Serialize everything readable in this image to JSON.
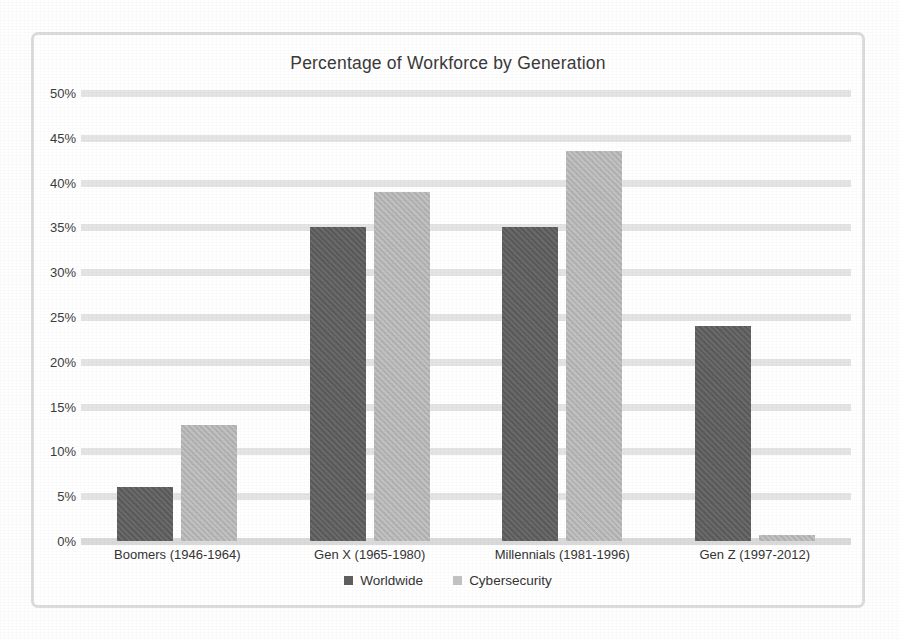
{
  "chart_data": {
    "type": "bar",
    "title": "Percentage of Workforce by Generation",
    "xlabel": "",
    "ylabel": "",
    "ylim": [
      0,
      50
    ],
    "ytick_labels": [
      "50%",
      "45%",
      "40%",
      "35%",
      "30%",
      "25%",
      "20%",
      "15%",
      "10%",
      "5%",
      "0%"
    ],
    "ytick_values": [
      50,
      45,
      40,
      35,
      30,
      25,
      20,
      15,
      10,
      5,
      0
    ],
    "grid": true,
    "legend_position": "bottom",
    "categories": [
      "Boomers (1946-1964)",
      "Gen X (1965-1980)",
      "Millennials (1981-1996)",
      "Gen Z (1997-2012)"
    ],
    "series": [
      {
        "name": "Worldwide",
        "color": "#5f5f5f",
        "values": [
          6,
          35,
          35,
          24
        ]
      },
      {
        "name": "Cybersecurity",
        "color": "#b9b9b9",
        "values": [
          13,
          39,
          43.5,
          0.7
        ]
      }
    ]
  },
  "colors": {
    "frame_border": "#dcdcdc",
    "gridline": "#e4e4e4",
    "worldwide": "#5f5f5f",
    "cybersecurity": "#b9b9b9",
    "text": "#343434",
    "background": "#ffffff"
  }
}
